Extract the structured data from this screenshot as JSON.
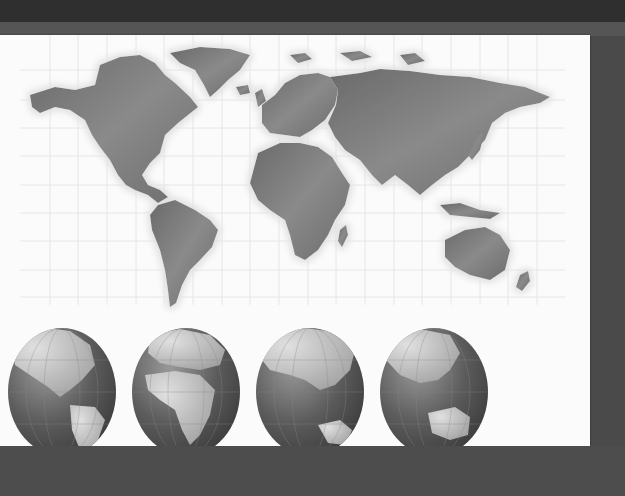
{
  "image": {
    "subject": "World map with four globes",
    "colors": {
      "background_dark": "#4a4a4a",
      "background_top": "#2f2f2f",
      "card": "#fbfbfb",
      "grid": "#e4e4e4",
      "land": "#7a7a7a",
      "land_dark": "#5f5f5f",
      "land_glow": "#e8e8e8",
      "globe_ocean": "#5a5a5a",
      "globe_land": "#bdbdbd"
    }
  },
  "world_map": {
    "continents": [
      "North America",
      "Greenland",
      "South America",
      "Europe",
      "Africa",
      "Asia",
      "Australia",
      "New Zealand",
      "Madagascar",
      "Japan",
      "Indonesia"
    ]
  },
  "globes": [
    {
      "view": "Americas"
    },
    {
      "view": "Europe and Africa"
    },
    {
      "view": "Asia and Indian Ocean"
    },
    {
      "view": "East Asia and Australia"
    }
  ]
}
